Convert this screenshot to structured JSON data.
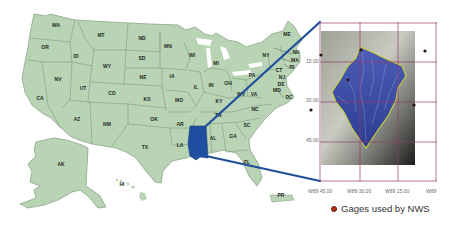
{
  "figure": {
    "highlight_state": "MS",
    "colors": {
      "land": "#b9d3b5",
      "border": "#7f9b7c",
      "highlight": "#1f4fa0",
      "connector": "#1f4f9a",
      "grid": "#9a3b6e",
      "watershed_outline": "#c8d23a",
      "gage": "#b0301e"
    }
  },
  "states": [
    {
      "abbr": "WA",
      "x": 56,
      "y": 27
    },
    {
      "abbr": "OR",
      "x": 45,
      "y": 49
    },
    {
      "abbr": "CA",
      "x": 40,
      "y": 100
    },
    {
      "abbr": "ID",
      "x": 76,
      "y": 58
    },
    {
      "abbr": "NV",
      "x": 58,
      "y": 81
    },
    {
      "abbr": "MT",
      "x": 101,
      "y": 37
    },
    {
      "abbr": "WY",
      "x": 107,
      "y": 68
    },
    {
      "abbr": "UT",
      "x": 83,
      "y": 90
    },
    {
      "abbr": "CO",
      "x": 112,
      "y": 95
    },
    {
      "abbr": "AZ",
      "x": 77,
      "y": 121
    },
    {
      "abbr": "NM",
      "x": 107,
      "y": 126
    },
    {
      "abbr": "ND",
      "x": 142,
      "y": 40
    },
    {
      "abbr": "SD",
      "x": 142,
      "y": 60
    },
    {
      "abbr": "NE",
      "x": 143,
      "y": 79
    },
    {
      "abbr": "KS",
      "x": 147,
      "y": 101
    },
    {
      "abbr": "OK",
      "x": 154,
      "y": 121
    },
    {
      "abbr": "TX",
      "x": 145,
      "y": 149
    },
    {
      "abbr": "MN",
      "x": 168,
      "y": 48
    },
    {
      "abbr": "IA",
      "x": 172,
      "y": 78
    },
    {
      "abbr": "MO",
      "x": 179,
      "y": 102
    },
    {
      "abbr": "AR",
      "x": 180,
      "y": 126
    },
    {
      "abbr": "LA",
      "x": 180,
      "y": 147
    },
    {
      "abbr": "WI",
      "x": 192,
      "y": 57
    },
    {
      "abbr": "IL",
      "x": 196,
      "y": 89
    },
    {
      "abbr": "MI",
      "x": 216,
      "y": 65
    },
    {
      "abbr": "IN",
      "x": 211,
      "y": 87
    },
    {
      "abbr": "OH",
      "x": 228,
      "y": 85
    },
    {
      "abbr": "KY",
      "x": 219,
      "y": 103
    },
    {
      "abbr": "TN",
      "x": 218,
      "y": 117
    },
    {
      "abbr": "AL",
      "x": 213,
      "y": 140
    },
    {
      "abbr": "GA",
      "x": 233,
      "y": 138
    },
    {
      "abbr": "FL",
      "x": 247,
      "y": 164
    },
    {
      "abbr": "SC",
      "x": 247,
      "y": 127
    },
    {
      "abbr": "NC",
      "x": 255,
      "y": 111
    },
    {
      "abbr": "VA",
      "x": 254,
      "y": 96
    },
    {
      "abbr": "WV",
      "x": 241,
      "y": 96
    },
    {
      "abbr": "PA",
      "x": 252,
      "y": 77
    },
    {
      "abbr": "NY",
      "x": 266,
      "y": 57
    },
    {
      "abbr": "ME",
      "x": 287,
      "y": 36
    },
    {
      "abbr": "NH",
      "x": 296,
      "y": 54
    },
    {
      "abbr": "MA",
      "x": 295,
      "y": 62
    },
    {
      "abbr": "RI",
      "x": 292,
      "y": 69
    },
    {
      "abbr": "CT",
      "x": 279,
      "y": 72
    },
    {
      "abbr": "NJ",
      "x": 282,
      "y": 79
    },
    {
      "abbr": "DE",
      "x": 281,
      "y": 86
    },
    {
      "abbr": "MD",
      "x": 277,
      "y": 92
    },
    {
      "abbr": "DC",
      "x": 289,
      "y": 99
    },
    {
      "abbr": "AK",
      "x": 61,
      "y": 166
    },
    {
      "abbr": "HI",
      "x": 122,
      "y": 186
    },
    {
      "abbr": "PR",
      "x": 281,
      "y": 197
    }
  ],
  "inset": {
    "y_ticks": [
      "15.00",
      "30.00",
      "45.00"
    ],
    "x_ticks": [
      "W89 45.00",
      "W89 30.00",
      "W89 15.00",
      "W89"
    ]
  },
  "legend": {
    "label": "Gages used by NWS"
  }
}
